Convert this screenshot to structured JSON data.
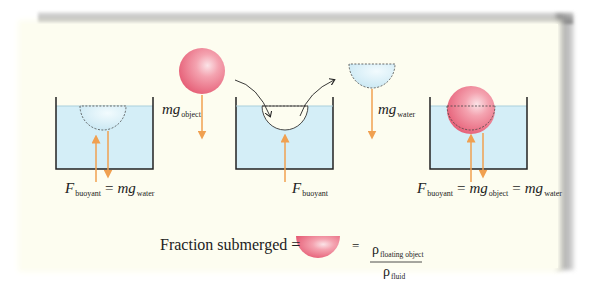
{
  "colors": {
    "background": "#fdfdf0",
    "water": "#d4eef7",
    "water_surface": "#a9cfdc",
    "tank_wall": "#222222",
    "object": "#ef8a9a",
    "force_arrow": "#f0a050",
    "dashed_outline": "#444444",
    "frame_shadow": "#8a8a8a"
  },
  "panels": [
    {
      "name": "floating-displaced-water",
      "label": {
        "F": "F",
        "F_sub": "buoyant",
        "eq": "=",
        "mg": "mg",
        "mg_sub": "water"
      }
    },
    {
      "name": "object-falling",
      "label": {
        "mg": "mg",
        "mg_sub": "object"
      }
    },
    {
      "name": "cavity-in-water",
      "label": {
        "F": "F",
        "F_sub": "buoyant"
      }
    },
    {
      "name": "displaced-water-lifted",
      "label": {
        "mg": "mg",
        "mg_sub": "water"
      }
    },
    {
      "name": "floating-object",
      "label": {
        "F": "F",
        "F_sub": "buoyant",
        "eq1": "=",
        "mg1": "mg",
        "mg1_sub": "object",
        "eq2": "=",
        "mg2": "mg",
        "mg2_sub": "water"
      }
    }
  ],
  "formula": {
    "left": "Fraction submerged =",
    "equals": "=",
    "numerator_symbol": "ρ",
    "numerator_sub": "floating object",
    "denominator_symbol": "ρ",
    "denominator_sub": "fluid"
  }
}
